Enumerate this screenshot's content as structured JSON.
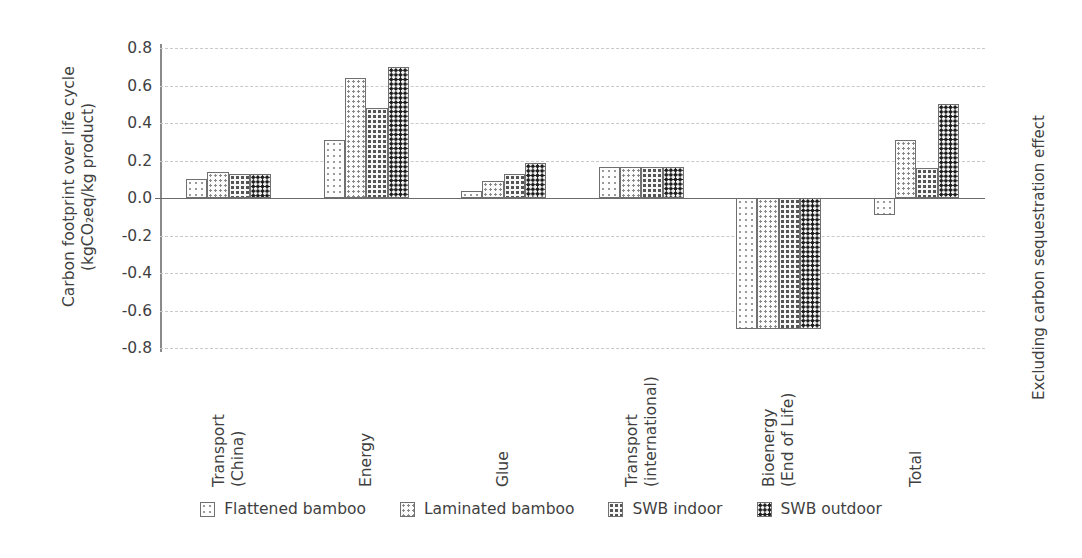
{
  "chart_data": {
    "type": "bar",
    "title": "",
    "ylabel": "Carbon footprint over life cycle\n(kgCO₂eq/kg product)",
    "ylabel_right": "Excluding carbon sequestration effect",
    "xlabel": "",
    "ylim": [
      -0.8,
      0.8
    ],
    "ytick_values": [
      0.8,
      0.6,
      0.4,
      0.2,
      0.0,
      -0.2,
      -0.4,
      -0.6,
      -0.8
    ],
    "ytick_labels": [
      "0.8",
      "0.6",
      "0.4",
      "0.2",
      "0.0",
      "-0.2",
      "-0.4",
      "-0.6",
      "-0.8"
    ],
    "grid": true,
    "grid_style": "dashed horizontal",
    "legend_position": "bottom-center",
    "categories": [
      "Transport\n(China)",
      "Energy",
      "Glue",
      "Transport\n(international)",
      "Bioenergy\n(End of Life)",
      "Total"
    ],
    "series": [
      {
        "name": "Flattened bamboo",
        "pattern": "light-dots",
        "values": [
          0.1,
          0.31,
          0.035,
          0.165,
          -0.7,
          -0.09
        ]
      },
      {
        "name": "Laminated bamboo",
        "pattern": "medium-dots",
        "values": [
          0.14,
          0.64,
          0.09,
          0.165,
          -0.7,
          0.31
        ]
      },
      {
        "name": "SWB indoor",
        "pattern": "dense-dots",
        "values": [
          0.13,
          0.48,
          0.13,
          0.165,
          -0.7,
          0.16
        ]
      },
      {
        "name": "SWB outdoor",
        "pattern": "very-dense-dots",
        "values": [
          0.13,
          0.7,
          0.185,
          0.165,
          -0.7,
          0.5
        ]
      }
    ],
    "colors": {
      "axis": "#6b6b6b",
      "grid": "#c9c9c9",
      "text": "#3f3f3f",
      "bar_outline": "#707070"
    }
  },
  "legend": {
    "items": [
      {
        "label": "Flattened bamboo"
      },
      {
        "label": "Laminated bamboo"
      },
      {
        "label": "SWB indoor"
      },
      {
        "label": "SWB outdoor"
      }
    ]
  }
}
